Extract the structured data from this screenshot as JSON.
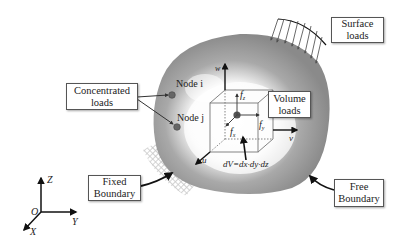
{
  "figure": {
    "colors": {
      "body_gray": "#8f8f8f",
      "body_light": "#ffffff",
      "line": "#111111",
      "box_border": "#555555",
      "hatch": "#bdbdbd"
    }
  },
  "labels": {
    "concentrated_loads": {
      "line1": "Concentrated",
      "line2": "loads"
    },
    "surface_loads": {
      "line1": "Surface",
      "line2": "loads"
    },
    "volume_loads": {
      "line1": "Volume",
      "line2": "loads"
    },
    "fixed_boundary": {
      "line1": "Fixed",
      "line2": "Boundary"
    },
    "free_boundary": {
      "line1": "Free",
      "line2": "Boundary"
    }
  },
  "nodes": {
    "node_i": "Node i",
    "node_j": "Node j"
  },
  "element": {
    "displacement_u": "u",
    "displacement_v": "v",
    "displacement_w": "w",
    "force_x": "f",
    "force_x_sub": "x",
    "force_y": "f",
    "force_y_sub": "y",
    "force_z": "f",
    "force_z_sub": "z",
    "volume_formula": "dV=dx·dy·dz"
  },
  "axes": {
    "x": "X",
    "y": "Y",
    "z": "Z",
    "origin": "O"
  }
}
